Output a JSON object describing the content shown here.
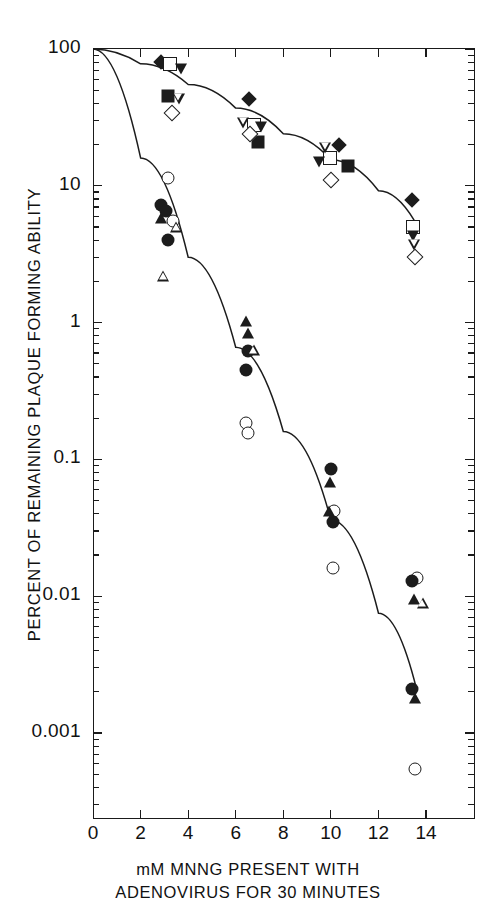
{
  "chart_data": {
    "type": "scatter",
    "title": "",
    "xlabel": "mM MNNG PRESENT WITH ADENOVIRUS FOR 30 MINUTES",
    "xlabel_line1": "mM MNNG PRESENT WITH",
    "xlabel_line2": "ADENOVIRUS FOR 30 MINUTES",
    "ylabel": "PERCENT OF REMAINING PLAQUE FORMING ABILITY",
    "yscale": "log",
    "xscale": "linear",
    "xlim": [
      0,
      16
    ],
    "ylim": [
      0.0003,
      100
    ],
    "grid": false,
    "legend": false,
    "xticks": [
      0,
      2,
      4,
      6,
      8,
      10,
      12,
      14
    ],
    "xticklabels": [
      "0",
      "2",
      "4",
      "6",
      "8",
      "10",
      "12",
      "14"
    ],
    "yticks": [
      100,
      10,
      1,
      0.1,
      0.01,
      0.001
    ],
    "yticklabels": [
      "100",
      "10",
      "1",
      "0.1",
      "0.01",
      "0.001"
    ],
    "series": [
      {
        "name": "resistant-upper-curve",
        "marker": "curve",
        "fit_points": [
          [
            0,
            100
          ],
          [
            2,
            78
          ],
          [
            4,
            55
          ],
          [
            6,
            37
          ],
          [
            8,
            24
          ],
          [
            10,
            15.5
          ],
          [
            12,
            9.2
          ],
          [
            13.5,
            5.6
          ]
        ]
      },
      {
        "name": "sensitive-lower-curve",
        "marker": "curve",
        "fit_points": [
          [
            0,
            100
          ],
          [
            2,
            16
          ],
          [
            4,
            3.0
          ],
          [
            6,
            0.66
          ],
          [
            8,
            0.16
          ],
          [
            10,
            0.036
          ],
          [
            12,
            0.0075
          ],
          [
            13.6,
            0.0021
          ]
        ]
      },
      {
        "name": "filled-diamond",
        "marker": "filled-diamond",
        "points": [
          [
            2.85,
            80
          ],
          [
            6.55,
            43
          ],
          [
            10.35,
            20
          ],
          [
            13.4,
            7.9
          ]
        ]
      },
      {
        "name": "open-square",
        "marker": "open-square",
        "points": [
          [
            3.25,
            78
          ],
          [
            9.95,
            16
          ],
          [
            13.45,
            5.0
          ],
          [
            6.75,
            28
          ]
        ]
      },
      {
        "name": "filled-down-triangle",
        "marker": "filled-down-triangle",
        "points": [
          [
            3.7,
            72
          ],
          [
            7.05,
            27
          ],
          [
            9.5,
            15
          ],
          [
            13.45,
            4.3
          ]
        ]
      },
      {
        "name": "filled-square",
        "marker": "filled-square",
        "points": [
          [
            3.15,
            45
          ],
          [
            6.95,
            21
          ],
          [
            10.7,
            14
          ]
        ]
      },
      {
        "name": "open-down-triangle",
        "marker": "open-down-triangle",
        "points": [
          [
            3.6,
            43
          ],
          [
            6.3,
            29
          ],
          [
            9.75,
            19
          ],
          [
            13.5,
            3.7
          ]
        ]
      },
      {
        "name": "open-diamond",
        "marker": "open-diamond",
        "points": [
          [
            3.3,
            34
          ],
          [
            6.6,
            24
          ],
          [
            10.0,
            11
          ],
          [
            13.55,
            3.0
          ]
        ]
      },
      {
        "name": "open-circle",
        "marker": "open-circle",
        "points": [
          [
            3.15,
            11.5
          ],
          [
            3.35,
            5.5
          ],
          [
            6.45,
            0.185
          ],
          [
            6.5,
            0.155
          ],
          [
            10.15,
            0.042
          ],
          [
            10.1,
            0.016
          ],
          [
            13.6,
            0.0135
          ],
          [
            13.55,
            0.00055
          ]
        ]
      },
      {
        "name": "filled-circle",
        "marker": "filled-circle",
        "points": [
          [
            2.85,
            7.2
          ],
          [
            3.05,
            6.6
          ],
          [
            3.15,
            4.0
          ],
          [
            6.5,
            0.62
          ],
          [
            6.45,
            0.45
          ],
          [
            10.0,
            0.085
          ],
          [
            10.1,
            0.035
          ],
          [
            13.4,
            0.013
          ],
          [
            13.4,
            0.0021
          ]
        ]
      },
      {
        "name": "filled-up-triangle",
        "marker": "filled-up-triangle",
        "points": [
          [
            2.85,
            5.8
          ],
          [
            6.45,
            1.02
          ],
          [
            6.5,
            0.84
          ],
          [
            9.95,
            0.068
          ],
          [
            9.9,
            0.042
          ],
          [
            13.5,
            0.0095
          ],
          [
            13.55,
            0.0018
          ]
        ]
      },
      {
        "name": "open-up-triangle",
        "marker": "open-up-triangle",
        "points": [
          [
            3.5,
            5.0
          ],
          [
            2.95,
            2.2
          ],
          [
            6.75,
            0.63
          ],
          [
            13.85,
            0.009
          ]
        ]
      }
    ]
  },
  "axes": {
    "y_title": "PERCENT OF REMAINING PLAQUE FORMING ABILITY",
    "x_title_line1": "mM MNNG PRESENT WITH",
    "x_title_line2": "ADENOVIRUS FOR 30 MINUTES",
    "y_tick_labels": [
      "100",
      "10",
      "1",
      "0.1",
      "0.01",
      "0.001"
    ],
    "x_tick_labels": [
      "0",
      "2",
      "4",
      "6",
      "8",
      "10",
      "12",
      "14"
    ]
  },
  "colors": {
    "ink": "#1c1c1c",
    "background": "#ffffff"
  }
}
